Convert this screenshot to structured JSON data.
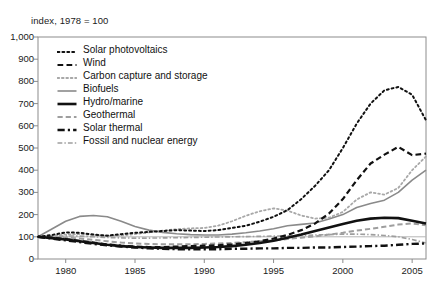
{
  "chart_data": {
    "type": "line",
    "title": "",
    "subtitle": "",
    "axis_unit_label": "index, 1978 = 100",
    "xlabel": "",
    "ylabel": "",
    "xlim": [
      1978,
      2006
    ],
    "ylim": [
      0,
      1000
    ],
    "grid": false,
    "reference_line_y": 100,
    "legend_position": "top-left inside plot",
    "ytick_labels": [
      "1,000",
      "900",
      "800",
      "700",
      "600",
      "500",
      "400",
      "300",
      "200",
      "100",
      "0"
    ],
    "ytick_values": [
      1000,
      900,
      800,
      700,
      600,
      500,
      400,
      300,
      200,
      100,
      0
    ],
    "xtick_labels": [
      "1980",
      "1985",
      "1990",
      "1995",
      "2000",
      "2005"
    ],
    "xtick_values": [
      1980,
      1985,
      1990,
      1995,
      2000,
      2005
    ],
    "x": [
      1978,
      1979,
      1980,
      1981,
      1982,
      1983,
      1984,
      1985,
      1986,
      1987,
      1988,
      1989,
      1990,
      1991,
      1992,
      1993,
      1994,
      1995,
      1996,
      1997,
      1998,
      1999,
      2000,
      2001,
      2002,
      2003,
      2004,
      2005,
      2006
    ],
    "series": [
      {
        "name": "Solar photovoltaics",
        "style": "dotted",
        "color": "#111111",
        "width": 2.0,
        "values": [
          100,
          108,
          120,
          118,
          110,
          105,
          112,
          118,
          122,
          126,
          130,
          128,
          126,
          130,
          140,
          150,
          168,
          190,
          220,
          270,
          330,
          400,
          500,
          610,
          700,
          760,
          775,
          740,
          625
        ]
      },
      {
        "name": "Wind",
        "style": "dashed",
        "color": "#111111",
        "width": 2.2,
        "values": [
          100,
          96,
          90,
          82,
          74,
          66,
          60,
          56,
          54,
          54,
          56,
          58,
          60,
          62,
          66,
          72,
          80,
          92,
          108,
          130,
          160,
          205,
          270,
          355,
          430,
          470,
          505,
          468,
          475
        ]
      },
      {
        "name": "Carbon capture and storage",
        "style": "dotted",
        "color": "#a8a8a8",
        "width": 1.8,
        "values": [
          100,
          104,
          110,
          112,
          108,
          104,
          106,
          112,
          120,
          128,
          134,
          138,
          140,
          150,
          170,
          195,
          215,
          228,
          218,
          196,
          182,
          186,
          212,
          268,
          300,
          290,
          320,
          400,
          462
        ]
      },
      {
        "name": "Biofuels",
        "style": "solid",
        "color": "#8a8a8a",
        "width": 1.6,
        "values": [
          100,
          135,
          170,
          192,
          196,
          190,
          170,
          146,
          130,
          120,
          114,
          110,
          108,
          108,
          112,
          118,
          126,
          136,
          150,
          156,
          162,
          180,
          200,
          232,
          250,
          265,
          300,
          355,
          400
        ]
      },
      {
        "name": "Hydro/marine",
        "style": "solid",
        "color": "#111111",
        "width": 2.6,
        "values": [
          100,
          94,
          88,
          80,
          72,
          64,
          58,
          54,
          52,
          50,
          50,
          50,
          52,
          54,
          58,
          64,
          72,
          82,
          96,
          110,
          126,
          142,
          158,
          172,
          182,
          186,
          184,
          172,
          160
        ]
      },
      {
        "name": "Geothermal",
        "style": "dashed",
        "color": "#9e9e9e",
        "width": 2.0,
        "values": [
          100,
          98,
          96,
          92,
          86,
          80,
          74,
          70,
          68,
          66,
          66,
          66,
          68,
          70,
          72,
          76,
          80,
          84,
          90,
          96,
          102,
          110,
          118,
          128,
          136,
          145,
          155,
          160,
          152
        ]
      },
      {
        "name": "Solar thermal",
        "style": "dash-dot",
        "color": "#111111",
        "width": 2.4,
        "values": [
          100,
          92,
          84,
          76,
          68,
          62,
          56,
          52,
          48,
          46,
          44,
          44,
          44,
          44,
          46,
          46,
          48,
          48,
          50,
          50,
          52,
          52,
          54,
          56,
          58,
          60,
          64,
          68,
          70
        ]
      },
      {
        "name": "Fossil and nuclear energy",
        "style": "dash-dot",
        "color": "#9e9e9e",
        "width": 1.6,
        "values": [
          100,
          102,
          104,
          103,
          100,
          97,
          95,
          94,
          94,
          95,
          96,
          97,
          98,
          99,
          100,
          101,
          102,
          103,
          104,
          106,
          108,
          110,
          112,
          112,
          110,
          106,
          100,
          88,
          72
        ]
      }
    ]
  }
}
